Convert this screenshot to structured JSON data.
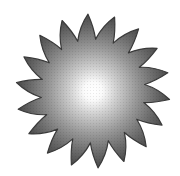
{
  "image": {
    "subject": "sun-starburst",
    "description": "Grayscale starburst sun with radial gradient, bright white center fading to dark gray spiky edges",
    "spike_count": 18,
    "center": [
      93,
      91
    ],
    "outer_radius": 77,
    "inner_radius": 52,
    "colors": {
      "background": "#ffffff",
      "center": "#ffffff",
      "mid": "#a8a8a8",
      "edge": "#4a4a4a",
      "outline": "#333333"
    }
  }
}
